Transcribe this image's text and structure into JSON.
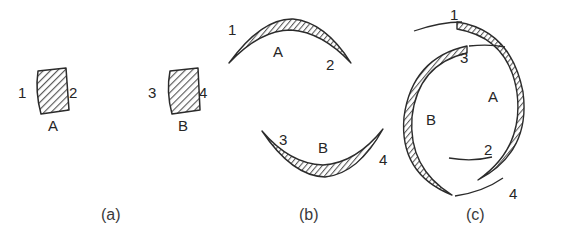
{
  "figure": {
    "background_color": "#ffffff",
    "ink_color": "#2b2b2b",
    "hatch_color": "#555555",
    "panels": [
      {
        "caption": "(a)",
        "caption_x": 101,
        "caption_y": 206,
        "description": "Two separate straight hatched segments A and B, undeformed",
        "shapes": [
          {
            "part_label": "A",
            "part_x": 48,
            "part_y": 118,
            "end_labels": [
              {
                "text": "1",
                "x": 18,
                "y": 85
              },
              {
                "text": "2",
                "x": 69,
                "y": 85
              }
            ]
          },
          {
            "part_label": "B",
            "part_x": 178,
            "part_y": 118,
            "end_labels": [
              {
                "text": "3",
                "x": 148,
                "y": 85
              },
              {
                "text": "4",
                "x": 199,
                "y": 85
              }
            ]
          }
        ]
      },
      {
        "caption": "(b)",
        "caption_x": 299,
        "caption_y": 206,
        "description": "Segments A and B bent into opposing crescent arcs",
        "shapes": [
          {
            "part_label": "A",
            "part_x": 273,
            "part_y": 44,
            "end_labels": [
              {
                "text": "1",
                "x": 228,
                "y": 22
              },
              {
                "text": "2",
                "x": 326,
                "y": 57
              }
            ]
          },
          {
            "part_label": "B",
            "part_x": 318,
            "part_y": 140,
            "end_labels": [
              {
                "text": "3",
                "x": 279,
                "y": 132
              },
              {
                "text": "4",
                "x": 379,
                "y": 152
              }
            ]
          }
        ]
      },
      {
        "caption": "(c)",
        "caption_x": 466,
        "caption_y": 206,
        "description": "Segments A and B curled into an almost closed double ring",
        "shapes": [
          {
            "part_label": "A",
            "part_x": 488,
            "part_y": 89,
            "end_labels": [
              {
                "text": "1",
                "x": 450,
                "y": 7
              },
              {
                "text": "2",
                "x": 484,
                "y": 142
              }
            ]
          },
          {
            "part_label": "B",
            "part_x": 426,
            "part_y": 112,
            "end_labels": [
              {
                "text": "3",
                "x": 460,
                "y": 50
              },
              {
                "text": "4",
                "x": 509,
                "y": 186
              }
            ]
          }
        ]
      }
    ]
  }
}
